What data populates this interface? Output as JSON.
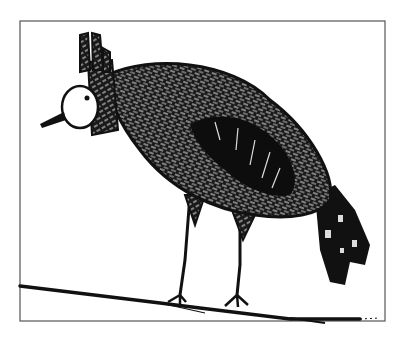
{
  "image": {
    "subject": "child's ink drawing of a crested bird standing on a branch",
    "colors": {
      "background": "#ffffff",
      "ink": "#111111",
      "frame": "#555555",
      "texture_light": "#e8e8e8"
    }
  }
}
